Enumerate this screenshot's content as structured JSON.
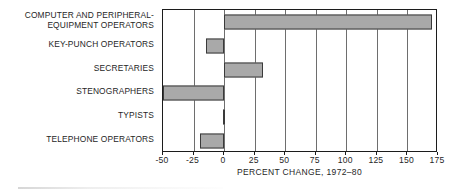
{
  "chart_data": {
    "type": "bar",
    "orientation": "horizontal",
    "title": "",
    "xlabel": "PERCENT CHANGE, 1972–80",
    "ylabel": "",
    "xlim": [
      -50,
      175
    ],
    "xticks": [
      -50,
      -25,
      0,
      25,
      50,
      75,
      100,
      125,
      150,
      175
    ],
    "xtick_labels": [
      "-50",
      "-25",
      "0",
      "25",
      "50",
      "75",
      "100",
      "125",
      "150",
      "175"
    ],
    "grid": "vertical",
    "legend": "none",
    "bar_fill_color": "#a9a9a9",
    "bar_edge_color": "#3a3a3a",
    "categories": [
      "COMPUTER AND PERIPHERAL-\nEQUIPMENT OPERATORS",
      "KEY-PUNCH OPERATORS",
      "SECRETARIES",
      "STENOGRAPHERS",
      "TYPISTS",
      "TELEPHONE  OPERATORS"
    ],
    "values": [
      170,
      -15,
      32,
      -50,
      -1,
      -20
    ]
  },
  "axis": {
    "title": "PERCENT CHANGE, 1972–80"
  }
}
